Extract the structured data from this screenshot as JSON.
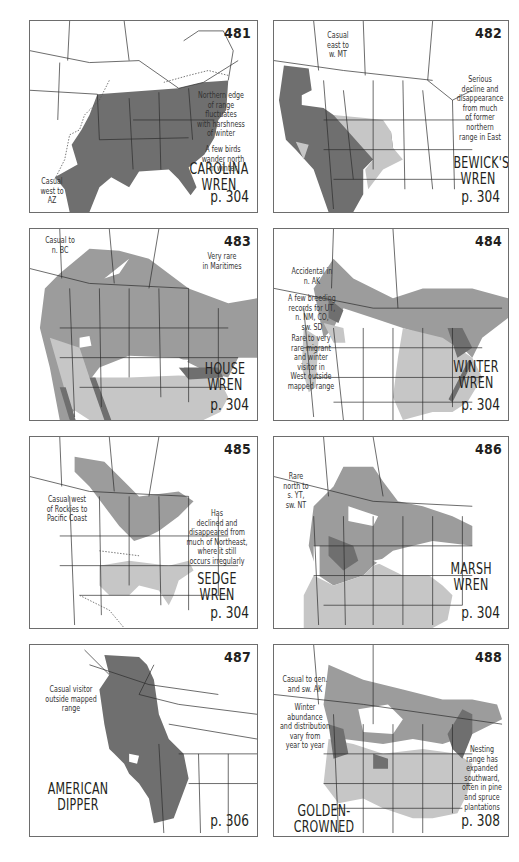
{
  "page": {
    "background": "#ffffff",
    "range_colors": {
      "dark": "#6f6f6f",
      "medium": "#9c9c9c",
      "light": "#c6c6c6",
      "border": "#6d6d6d"
    }
  },
  "maps": [
    {
      "number": "481",
      "species": "CAROLINA\nWREN",
      "page_ref": "p. 304",
      "notes": [
        "Northern edge\nof range\nfluctuates\nwith harshness\nof winter",
        "A few birds\nwander north\nin winter",
        "Casual\nwest to\nAZ"
      ]
    },
    {
      "number": "482",
      "species": "BEWICK'S\nWREN",
      "page_ref": "p. 304",
      "notes": [
        "Casual\neast to\nw. MT",
        "Serious\ndecline and\ndisappearance\nfrom much\nof former\nnorthern\nrange in East"
      ]
    },
    {
      "number": "483",
      "species": "HOUSE\nWREN",
      "page_ref": "p. 304",
      "notes": [
        "Casual to\nn. BC",
        "Very rare\nin Maritimes"
      ]
    },
    {
      "number": "484",
      "species": "WINTER\nWREN",
      "page_ref": "p. 304",
      "notes": [
        "Accidental in\nn. AK",
        "A few breeding\nrecords for UT,\nn. NM, CO,\nsw. SD",
        "Rare to very\nrare migrant\nand winter\nvisitor in\nWest outside\nmapped range"
      ]
    },
    {
      "number": "485",
      "species": "SEDGE\nWREN",
      "page_ref": "p. 304",
      "notes": [
        "Casual west\nof Rockies to\nPacific Coast",
        "Has\ndeclined and\ndisappeared from\nmuch of Northeast,\nwhere it still\noccurs irregularly"
      ]
    },
    {
      "number": "486",
      "species": "MARSH\nWREN",
      "page_ref": "p. 304",
      "notes": [
        "Rare\nnorth to\ns. YT,\nsw. NT"
      ]
    },
    {
      "number": "487",
      "species": "AMERICAN\nDIPPER",
      "page_ref": "p. 306",
      "notes": [
        "Casual visitor\noutside mapped\nrange"
      ]
    },
    {
      "number": "488",
      "species": "GOLDEN-CROWNED\nKINGLET",
      "page_ref": "p. 308",
      "notes": [
        "Casual to cen.\nand sw. AK",
        "Winter\nabundance\nand distribution\nvary from\nyear to year",
        "Nesting\nrange has\nexpanded\nsouthward,\noften in pine\nand spruce\nplantations"
      ]
    }
  ]
}
